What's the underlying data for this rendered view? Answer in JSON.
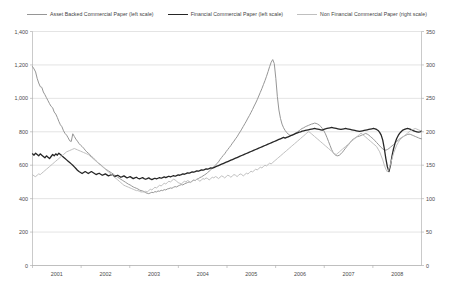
{
  "chart_data": {
    "type": "line",
    "title": "",
    "subtitle": "",
    "xlabel": "",
    "ylabel": "",
    "grid": true,
    "legend_position": "top",
    "x_tick_labels": [
      "2001",
      "2002",
      "2003",
      "2004",
      "2005",
      "2006",
      "2007",
      "2008"
    ],
    "left_axis": {
      "label": "",
      "ylim": [
        0,
        1400
      ],
      "tick_step": 200,
      "tick_labels": [
        "0",
        "200",
        "400",
        "600",
        "800",
        "1,000",
        "1,200",
        "1,400"
      ],
      "tick_values": [
        0,
        200,
        400,
        600,
        800,
        1000,
        1200,
        1400
      ]
    },
    "right_axis": {
      "label": "",
      "ylim": [
        0,
        350
      ],
      "tick_step": 50,
      "tick_labels": [
        "0",
        "50",
        "100",
        "150",
        "200",
        "250",
        "300",
        "350"
      ],
      "tick_values": [
        0,
        50,
        100,
        150,
        200,
        250,
        300,
        350
      ]
    },
    "x_range": [
      2001.0,
      2009.0
    ],
    "series": [
      {
        "name": "Asset Backed Commercial Paper (left scale)",
        "axis": "left",
        "color": "#969696",
        "stroke_width": 1.0,
        "values": [
          1190,
          1176,
          1158,
          1120,
          1092,
          1070,
          1066,
          1038,
          1022,
          1004,
          986,
          968,
          952,
          944,
          918,
          906,
          886,
          862,
          842,
          830,
          806,
          790,
          780,
          764,
          746,
          742,
          788,
          772,
          756,
          744,
          730,
          720,
          712,
          702,
          690,
          680,
          672,
          664,
          652,
          646,
          636,
          626,
          618,
          608,
          604,
          594,
          586,
          578,
          572,
          566,
          560,
          554,
          548,
          540,
          536,
          528,
          522,
          516,
          510,
          504,
          498,
          492,
          486,
          482,
          476,
          470,
          466,
          462,
          458,
          452,
          448,
          446,
          442,
          436,
          432,
          430,
          434,
          438,
          436,
          442,
          440,
          446,
          444,
          450,
          448,
          454,
          452,
          458,
          460,
          464,
          462,
          468,
          472,
          470,
          476,
          480,
          484,
          482,
          488,
          492,
          496,
          500,
          498,
          506,
          510,
          508,
          516,
          520,
          526,
          530,
          536,
          542,
          548,
          556,
          564,
          572,
          582,
          590,
          600,
          610,
          620,
          634,
          646,
          658,
          668,
          682,
          694,
          706,
          718,
          732,
          744,
          758,
          770,
          786,
          800,
          816,
          832,
          848,
          864,
          882,
          898,
          916,
          934,
          954,
          972,
          992,
          1014,
          1036,
          1058,
          1082,
          1106,
          1132,
          1160,
          1190,
          1216,
          1232,
          1208,
          1120,
          1010,
          930,
          880,
          846,
          824,
          808,
          796,
          786,
          780,
          778,
          782,
          788,
          794,
          800,
          806,
          814,
          820,
          824,
          830,
          834,
          838,
          842,
          846,
          848,
          852,
          850,
          846,
          840,
          832,
          820,
          806,
          788,
          766,
          742,
          718,
          694,
          676,
          664,
          658,
          656,
          660,
          668,
          678,
          690,
          702,
          714,
          724,
          736,
          748,
          756,
          762,
          768,
          772,
          774,
          778,
          782,
          786,
          790,
          786,
          780,
          772,
          764,
          756,
          746,
          736,
          726,
          716,
          706,
          698,
          692,
          690,
          694,
          700,
          708,
          716,
          724,
          732,
          742,
          750,
          758,
          764,
          770,
          776,
          780,
          784,
          786,
          784,
          780,
          776,
          772,
          768,
          764,
          760,
          758
        ]
      },
      {
        "name": "Financial Commercial Paper (left scale)",
        "axis": "left",
        "color": "#262626",
        "stroke_width": 1.3,
        "values": [
          668,
          660,
          672,
          664,
          656,
          668,
          660,
          652,
          644,
          656,
          648,
          640,
          652,
          664,
          656,
          668,
          660,
          672,
          664,
          656,
          648,
          640,
          632,
          624,
          616,
          608,
          600,
          590,
          580,
          570,
          562,
          556,
          550,
          556,
          562,
          556,
          550,
          556,
          562,
          556,
          550,
          544,
          548,
          552,
          546,
          540,
          544,
          548,
          542,
          536,
          540,
          544,
          538,
          532,
          536,
          540,
          534,
          528,
          532,
          536,
          530,
          524,
          528,
          532,
          526,
          520,
          524,
          528,
          522,
          518,
          522,
          526,
          520,
          516,
          520,
          524,
          518,
          514,
          518,
          522,
          518,
          522,
          526,
          522,
          526,
          530,
          526,
          530,
          534,
          530,
          534,
          538,
          534,
          538,
          542,
          540,
          544,
          548,
          546,
          550,
          554,
          552,
          556,
          560,
          558,
          562,
          566,
          564,
          568,
          572,
          570,
          574,
          578,
          576,
          580,
          584,
          582,
          586,
          590,
          594,
          598,
          602,
          606,
          610,
          614,
          618,
          622,
          626,
          630,
          634,
          638,
          642,
          646,
          650,
          654,
          658,
          662,
          666,
          670,
          674,
          678,
          682,
          686,
          690,
          694,
          698,
          702,
          706,
          710,
          714,
          718,
          722,
          726,
          730,
          734,
          738,
          742,
          746,
          750,
          754,
          758,
          762,
          766,
          762,
          766,
          770,
          774,
          778,
          782,
          786,
          790,
          794,
          798,
          800,
          804,
          806,
          808,
          810,
          812,
          814,
          816,
          818,
          820,
          818,
          816,
          814,
          812,
          810,
          814,
          818,
          820,
          822,
          824,
          826,
          824,
          822,
          820,
          818,
          816,
          814,
          816,
          818,
          820,
          818,
          816,
          814,
          812,
          810,
          808,
          806,
          804,
          802,
          804,
          806,
          808,
          810,
          812,
          814,
          816,
          818,
          820,
          818,
          814,
          808,
          796,
          780,
          750,
          700,
          640,
          590,
          562,
          600,
          656,
          700,
          734,
          760,
          778,
          792,
          802,
          810,
          814,
          818,
          820,
          818,
          814,
          810,
          806,
          802,
          800,
          798,
          800,
          804
        ]
      },
      {
        "name": "Non Financial Commercial Paper (right scale)",
        "axis": "right",
        "color": "#bfbfbf",
        "stroke_width": 1.0,
        "values": [
          136,
          134,
          133,
          135,
          137,
          136,
          138,
          140,
          142,
          144,
          146,
          148,
          150,
          152,
          154,
          156,
          158,
          160,
          162,
          164,
          166,
          168,
          170,
          171,
          172,
          173,
          174,
          175,
          174,
          173,
          172,
          171,
          170,
          169,
          168,
          167,
          166,
          164,
          162,
          160,
          158,
          156,
          154,
          152,
          150,
          148,
          146,
          144,
          142,
          140,
          138,
          136,
          134,
          132,
          130,
          128,
          126,
          124,
          122,
          120,
          119,
          118,
          117,
          116,
          115,
          114,
          113,
          112,
          112,
          111,
          110,
          110,
          110,
          111,
          110,
          112,
          114,
          113,
          115,
          117,
          116,
          118,
          120,
          119,
          121,
          123,
          122,
          124,
          126,
          125,
          127,
          129,
          128,
          126,
          124,
          123,
          122,
          124,
          126,
          125,
          127,
          126,
          124,
          126,
          128,
          127,
          129,
          128,
          126,
          128,
          130,
          129,
          131,
          130,
          128,
          130,
          132,
          131,
          133,
          132,
          130,
          132,
          134,
          133,
          131,
          133,
          135,
          134,
          132,
          134,
          136,
          135,
          133,
          135,
          137,
          136,
          134,
          136,
          138,
          137,
          139,
          141,
          140,
          142,
          144,
          143,
          145,
          147,
          146,
          148,
          150,
          149,
          151,
          153,
          152,
          154,
          156,
          158,
          160,
          162,
          164,
          166,
          168,
          170,
          172,
          174,
          176,
          178,
          180,
          182,
          184,
          186,
          188,
          190,
          192,
          194,
          196,
          198,
          200,
          199,
          197,
          195,
          193,
          191,
          189,
          187,
          185,
          183,
          181,
          179,
          177,
          175,
          173,
          171,
          169,
          167,
          166,
          168,
          170,
          172,
          174,
          176,
          178,
          180,
          182,
          184,
          186,
          188,
          190,
          192,
          194,
          196,
          198,
          196,
          194,
          192,
          190,
          188,
          186,
          184,
          182,
          180,
          178,
          174,
          170,
          164,
          158,
          150,
          144,
          140,
          144,
          152,
          160,
          168,
          174,
          180,
          184,
          188,
          190,
          192,
          194,
          196,
          198,
          200,
          202,
          203,
          204,
          205,
          204,
          203,
          202,
          201
        ]
      }
    ]
  }
}
